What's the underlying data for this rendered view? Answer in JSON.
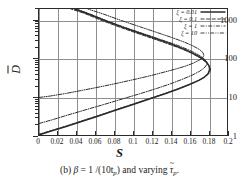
{
  "chart_data": {
    "type": "line",
    "title": "",
    "xlabel": "S",
    "ylabel": "D̄",
    "yscale": "log",
    "xscale": "linear",
    "xlim": [
      0,
      0.2
    ],
    "ylim": [
      1,
      2000
    ],
    "grid": true,
    "legend_position": "top-right",
    "xticks": [
      "0",
      "0.02",
      "0.04",
      "0.06",
      "0.08",
      "0.1",
      "0.12",
      "0.14",
      "0.16",
      "0.18",
      "0.2"
    ],
    "xtick_values": [
      0,
      0.02,
      0.04,
      0.06,
      0.08,
      0.1,
      0.12,
      0.14,
      0.16,
      0.18,
      0.2
    ],
    "yticks": [
      "1",
      "10",
      "100",
      "1000"
    ],
    "ytick_values": [
      1,
      10,
      100,
      1000
    ],
    "series": [
      {
        "name": "xi = 0.01",
        "label_symbol": "ξ",
        "label_value": "0.01",
        "style": "solid",
        "width": 1.5,
        "points": [
          [
            0.0,
            1.0
          ],
          [
            0.012,
            1.25
          ],
          [
            0.028,
            1.65
          ],
          [
            0.046,
            2.3
          ],
          [
            0.064,
            3.2
          ],
          [
            0.082,
            4.5
          ],
          [
            0.1,
            6.3
          ],
          [
            0.118,
            8.9
          ],
          [
            0.134,
            12.0
          ],
          [
            0.148,
            16.0
          ],
          [
            0.16,
            21.0
          ],
          [
            0.17,
            27.0
          ],
          [
            0.176,
            33.0
          ],
          [
            0.18,
            41.0
          ],
          [
            0.1815,
            52.0
          ],
          [
            0.181,
            64.0
          ],
          [
            0.1785,
            80.0
          ],
          [
            0.174,
            100.0
          ],
          [
            0.166,
            130.0
          ],
          [
            0.155,
            175.0
          ],
          [
            0.141,
            240.0
          ],
          [
            0.125,
            330.0
          ],
          [
            0.107,
            470.0
          ],
          [
            0.088,
            680.0
          ],
          [
            0.07,
            1000.0
          ],
          [
            0.052,
            1500.0
          ],
          [
            0.038,
            2000.0
          ]
        ]
      },
      {
        "name": "xi = 0.1",
        "label_symbol": "ξ",
        "label_value": "0.1",
        "style": "dashed",
        "width": 1.0,
        "points": [
          [
            0.0,
            1.05
          ],
          [
            0.013,
            1.3
          ],
          [
            0.03,
            1.75
          ],
          [
            0.048,
            2.45
          ],
          [
            0.066,
            3.4
          ],
          [
            0.084,
            4.8
          ],
          [
            0.102,
            6.7
          ],
          [
            0.12,
            9.4
          ],
          [
            0.136,
            12.7
          ],
          [
            0.15,
            16.9
          ],
          [
            0.162,
            22.0
          ],
          [
            0.172,
            28.5
          ],
          [
            0.178,
            35.0
          ],
          [
            0.1815,
            43.0
          ],
          [
            0.1825,
            54.0
          ],
          [
            0.1805,
            67.0
          ],
          [
            0.177,
            84.0
          ],
          [
            0.171,
            106.0
          ],
          [
            0.162,
            140.0
          ],
          [
            0.15,
            188.0
          ],
          [
            0.135,
            256.0
          ],
          [
            0.119,
            350.0
          ],
          [
            0.101,
            495.0
          ],
          [
            0.083,
            710.0
          ],
          [
            0.065,
            1040.0
          ],
          [
            0.048,
            1550.0
          ],
          [
            0.034,
            2000.0
          ]
        ]
      },
      {
        "name": "xi = 1",
        "label_symbol": "ξ",
        "label_value": "1",
        "style": "dashdot",
        "width": 1.0,
        "points": [
          [
            0.0,
            2.0
          ],
          [
            0.014,
            2.5
          ],
          [
            0.03,
            3.3
          ],
          [
            0.05,
            4.6
          ],
          [
            0.07,
            6.4
          ],
          [
            0.09,
            9.0
          ],
          [
            0.108,
            12.2
          ],
          [
            0.125,
            16.5
          ],
          [
            0.14,
            22.0
          ],
          [
            0.152,
            28.5
          ],
          [
            0.163,
            37.0
          ],
          [
            0.171,
            47.0
          ],
          [
            0.176,
            58.0
          ],
          [
            0.1785,
            70.0
          ],
          [
            0.178,
            85.0
          ],
          [
            0.1745,
            105.0
          ],
          [
            0.168,
            133.0
          ],
          [
            0.158,
            175.0
          ],
          [
            0.145,
            235.0
          ],
          [
            0.129,
            320.0
          ],
          [
            0.111,
            450.0
          ],
          [
            0.092,
            650.0
          ],
          [
            0.073,
            960.0
          ],
          [
            0.055,
            1450.0
          ],
          [
            0.04,
            2000.0
          ]
        ]
      },
      {
        "name": "xi = 10",
        "label_symbol": "ξ",
        "label_value": "10",
        "style": "dashdotdot",
        "width": 1.0,
        "points": [
          [
            0.0,
            9.6
          ],
          [
            0.012,
            10.5
          ],
          [
            0.028,
            12.2
          ],
          [
            0.046,
            14.8
          ],
          [
            0.066,
            18.5
          ],
          [
            0.086,
            23.5
          ],
          [
            0.104,
            29.5
          ],
          [
            0.12,
            36.5
          ],
          [
            0.134,
            45.0
          ],
          [
            0.146,
            54.0
          ],
          [
            0.156,
            64.0
          ],
          [
            0.164,
            76.0
          ],
          [
            0.17,
            90.0
          ],
          [
            0.174,
            105.0
          ],
          [
            0.1755,
            122.0
          ],
          [
            0.1745,
            143.0
          ],
          [
            0.171,
            172.0
          ],
          [
            0.164,
            215.0
          ],
          [
            0.154,
            275.0
          ],
          [
            0.141,
            360.0
          ],
          [
            0.125,
            490.0
          ],
          [
            0.107,
            690.0
          ],
          [
            0.088,
            990.0
          ],
          [
            0.069,
            1460.0
          ],
          [
            0.052,
            2000.0
          ]
        ]
      }
    ]
  },
  "legend": {
    "entries": [
      {
        "label": "ξ = 0.01",
        "style": "solid"
      },
      {
        "label": "ξ = 0.1",
        "style": "dashed"
      },
      {
        "label": "ξ = 1",
        "style": "dashdot"
      },
      {
        "label": "ξ = 10",
        "style": "dashdotdot"
      }
    ]
  },
  "axes": {
    "x_title": "S",
    "y_title": "D"
  },
  "caption": {
    "prefix": "(b)",
    "beta": "β",
    "equals": "= 1 /(10t",
    "sub_p": "p",
    "close": ") and varying",
    "tau": "τ",
    "tau_sub": "p",
    "period": "."
  },
  "colors": {
    "curve": "#2b2b2b",
    "grid": "#8e8e8e",
    "frame": "#2b2b2b",
    "background": "#ffffff"
  }
}
